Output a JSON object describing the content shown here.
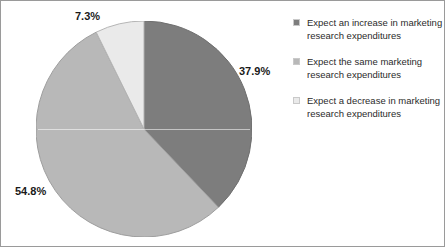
{
  "chart_data": {
    "type": "pie",
    "title": "",
    "labels": [
      "Expect an increase in marketing research expenditures",
      "Expect the same marketing research expenditures",
      "Expect a decrease in marketing research expenditures"
    ],
    "values": [
      37.9,
      54.8,
      7.3
    ],
    "value_labels": [
      "37.9%",
      "54.8%",
      "7.3%"
    ],
    "units": "percent",
    "total": 100.0,
    "colors": [
      "#7d7d7d",
      "#b8b8b8",
      "#eaeaea"
    ],
    "start_angle_deg": 0,
    "direction": "clockwise",
    "legend_position": "right",
    "grid": false
  },
  "labels": {
    "increase": "37.9%",
    "same": "54.8%",
    "decrease": "7.3%"
  },
  "legend": {
    "items": [
      {
        "line1": "Expect an increase in marketing",
        "line2": "research expenditures",
        "color": "#7d7d7d",
        "swatch_name": "legend-swatch-increase"
      },
      {
        "line1": "Expect the same marketing",
        "line2": "research expenditures",
        "color": "#b8b8b8",
        "swatch_name": "legend-swatch-same"
      },
      {
        "line1": "Expect a decrease in marketing",
        "line2": "research expenditures",
        "color": "#eaeaea",
        "swatch_name": "legend-swatch-decrease"
      }
    ]
  }
}
